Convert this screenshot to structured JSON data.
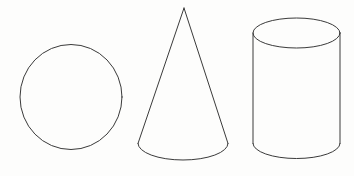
{
  "figure": {
    "background_color": "#fdfdfc",
    "stroke_color": "#3a3a3a",
    "stroke_width": 1,
    "width": 354,
    "height": 176,
    "shape_count": 3
  },
  "shapes": [
    {
      "id": "circle",
      "name": "Circle",
      "type": "circle",
      "order": 1,
      "geometry": {
        "center_x": 71,
        "center_y": 97,
        "radius_x": 51,
        "radius_y": 52.5,
        "left": 20,
        "right": 122,
        "top": 45,
        "bottom": 150
      }
    },
    {
      "id": "cone",
      "name": "Cone",
      "type": "cone",
      "order": 2,
      "geometry": {
        "apex_x": 184,
        "apex_y": 8,
        "base_center_x": 183,
        "base_center_y": 143.5,
        "base_radius_x": 45,
        "base_radius_y": 16.5,
        "base_left_x": 138,
        "base_right_x": 228,
        "base_lowest_y": 160
      }
    },
    {
      "id": "cylinder",
      "name": "Cylinder",
      "type": "cylinder",
      "order": 3,
      "geometry": {
        "center_x": 296.5,
        "radius_x": 43.5,
        "left": 253,
        "right": 340,
        "top_ellipse_center_y": 33,
        "top_ellipse_radius_y": 15,
        "top": 18,
        "bottom_ellipse_center_y": 143.5,
        "bottom_ellipse_radius_y": 15,
        "bottom": 158.5
      }
    }
  ]
}
